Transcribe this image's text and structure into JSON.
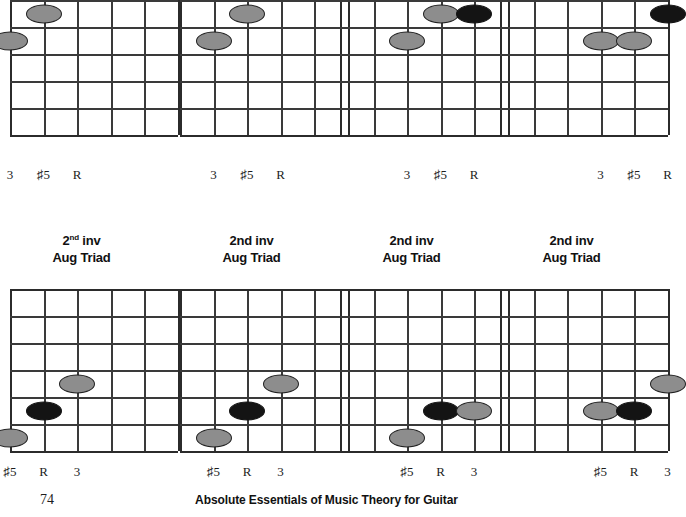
{
  "page": {
    "number": "74",
    "book_title": "Absolute Essentials of Music Theory for Guitar"
  },
  "captions": [
    {
      "line1_main": "2",
      "line1_sup": "nd",
      "line1_rest": " inv",
      "line2": "Aug Triad"
    },
    {
      "line1_main": "2nd",
      "line1_sup": "",
      "line1_rest": " inv",
      "line2": "Aug Triad"
    },
    {
      "line1_main": "2nd",
      "line1_sup": "",
      "line1_rest": " inv",
      "line2": "Aug Triad"
    },
    {
      "line1_main": "2nd",
      "line1_sup": "",
      "line1_rest": " inv",
      "line2": "Aug Triad"
    }
  ],
  "degree_labels": {
    "top": [
      "3",
      "♯5",
      "R"
    ],
    "bottom": [
      "♯5",
      "R",
      "3"
    ]
  },
  "diagrams": [
    {
      "name": "aug-triad-1",
      "row": "top",
      "strings": 5,
      "frets": 6,
      "dots": [
        {
          "string": 0,
          "fret": 3,
          "color": "gray"
        },
        {
          "string": 1,
          "fret": 2,
          "color": "gray"
        },
        {
          "string": 2,
          "fret": 1,
          "color": "black"
        }
      ],
      "label_strings": [
        0,
        1,
        2
      ]
    },
    {
      "name": "aug-triad-2",
      "row": "top",
      "strings": 5,
      "frets": 6,
      "dots": [
        {
          "string": 1,
          "fret": 3,
          "color": "gray"
        },
        {
          "string": 2,
          "fret": 2,
          "color": "gray"
        },
        {
          "string": 3,
          "fret": 1,
          "color": "black"
        }
      ],
      "label_strings": [
        1,
        2,
        3
      ]
    },
    {
      "name": "aug-triad-3",
      "row": "top",
      "strings": 5,
      "frets": 6,
      "dots": [
        {
          "string": 2,
          "fret": 3,
          "color": "gray"
        },
        {
          "string": 3,
          "fret": 2,
          "color": "gray"
        },
        {
          "string": 4,
          "fret": 2,
          "color": "black"
        }
      ],
      "label_strings": [
        2,
        3,
        4
      ]
    },
    {
      "name": "aug-triad-4",
      "row": "top",
      "strings": 5,
      "frets": 6,
      "dots": [
        {
          "string": 3,
          "fret": 3,
          "color": "gray"
        },
        {
          "string": 4,
          "fret": 3,
          "color": "gray"
        },
        {
          "string": 5,
          "fret": 2,
          "color": "black"
        }
      ],
      "label_strings": [
        3,
        4,
        5
      ]
    },
    {
      "name": "aug-triad-2nd-inv-1",
      "row": "bottom",
      "strings": 5,
      "frets": 6,
      "dots": [
        {
          "string": 0,
          "fret": 6,
          "color": "gray"
        },
        {
          "string": 1,
          "fret": 5,
          "color": "black"
        },
        {
          "string": 2,
          "fret": 4,
          "color": "gray"
        }
      ],
      "label_strings": [
        0,
        1,
        2
      ]
    },
    {
      "name": "aug-triad-2nd-inv-2",
      "row": "bottom",
      "strings": 5,
      "frets": 6,
      "dots": [
        {
          "string": 1,
          "fret": 6,
          "color": "gray"
        },
        {
          "string": 2,
          "fret": 5,
          "color": "black"
        },
        {
          "string": 3,
          "fret": 4,
          "color": "gray"
        }
      ],
      "label_strings": [
        1,
        2,
        3
      ]
    },
    {
      "name": "aug-triad-2nd-inv-3",
      "row": "bottom",
      "strings": 5,
      "frets": 6,
      "dots": [
        {
          "string": 2,
          "fret": 6,
          "color": "gray"
        },
        {
          "string": 3,
          "fret": 5,
          "color": "black"
        },
        {
          "string": 4,
          "fret": 5,
          "color": "gray"
        }
      ],
      "label_strings": [
        2,
        3,
        4
      ]
    },
    {
      "name": "aug-triad-2nd-inv-4",
      "row": "bottom",
      "strings": 5,
      "frets": 6,
      "dots": [
        {
          "string": 3,
          "fret": 5,
          "color": "gray"
        },
        {
          "string": 4,
          "fret": 5,
          "color": "black"
        },
        {
          "string": 5,
          "fret": 4,
          "color": "gray"
        }
      ],
      "label_strings": [
        3,
        4,
        5
      ]
    }
  ],
  "colors": {
    "dot_gray": "#8d8d8d",
    "dot_black": "#141414",
    "grid_line": "#2b2b2b",
    "paper": "#ffffff"
  }
}
